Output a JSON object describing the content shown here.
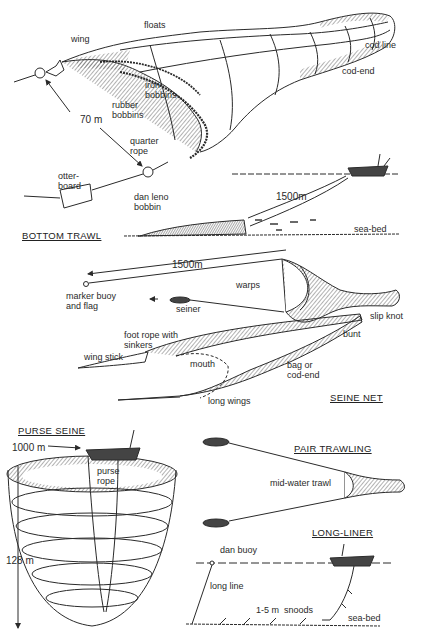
{
  "figure": {
    "panels": {
      "bottom_trawl": {
        "title": "BOTTOM TRAWL",
        "labels": {
          "wing": "wing",
          "floats": "floats",
          "cod_line": "cod line",
          "cod_end": "cod-end",
          "iron_bobbins": "iron\nbobbins",
          "rubber_bobbins": "rubber\nbobbins",
          "distance": "70 m",
          "quarter_rope": "quarter\nrope",
          "otter_board": "otter-\nboard",
          "dan_leno_bobbin": "dan leno\nbobbin",
          "warp_length": "1500m",
          "sea_bed": "sea-bed"
        }
      },
      "seine_net": {
        "title": "SEINE NET",
        "labels": {
          "distance": "1500m",
          "marker_buoy": "marker buoy\nand flag",
          "warps": "warps",
          "seiner": "seiner",
          "slip_knot": "slip knot",
          "bunt": "bunt",
          "foot_rope": "foot rope with\nsinkers",
          "wing_stick": "wing stick",
          "mouth": "mouth",
          "bag": "bag or\ncod-end",
          "long_wings": "long wings"
        }
      },
      "purse_seine": {
        "title": "PURSE SEINE",
        "labels": {
          "circumference": "1000 m",
          "purse_rope": "purse\nrope",
          "depth": "128 m"
        }
      },
      "pair_trawling": {
        "title": "PAIR TRAWLING",
        "labels": {
          "net": "mid-water trawl"
        }
      },
      "long_liner": {
        "title": "LONG-LINER",
        "labels": {
          "dan_buoy": "dan buoy",
          "long_line": "long line",
          "snoods": "1-5 m  snoods",
          "sea_bed": "sea-bed"
        }
      }
    },
    "colors": {
      "ink": "#2a2a2a",
      "hatch": "#555555",
      "background": "#ffffff"
    }
  }
}
